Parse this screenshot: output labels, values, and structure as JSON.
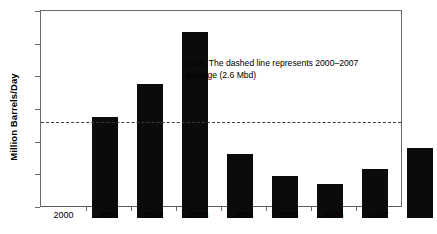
{
  "chart_data": {
    "type": "bar",
    "title": "",
    "subtitle": "",
    "xlabel": "",
    "ylabel": "Million Barrels/Day",
    "categories": [
      "2000",
      "2001",
      "2002",
      "2003",
      "2004",
      "2005",
      "2006",
      "2007"
    ],
    "values": [
      3.1,
      4.1,
      5.7,
      1.95,
      1.3,
      1.05,
      1.5,
      2.15
    ],
    "series": [
      {
        "name": "Production",
        "values": [
          3.1,
          4.1,
          5.7,
          1.95,
          1.3,
          1.05,
          1.5,
          2.15
        ]
      }
    ],
    "ylim": [
      0,
      6
    ],
    "ytick_values": [
      0,
      1,
      2,
      3,
      4,
      5,
      6
    ],
    "ytick_labels": [
      "0",
      "1",
      "2",
      "3",
      "4",
      "5",
      "6"
    ],
    "grid": false,
    "legend": false,
    "legend_position": "none",
    "bar_color": "#0b0b0b",
    "reference_line": {
      "value": 2.6,
      "style": "dashed",
      "color": "#3b3b3b",
      "label": "2000-2007 average (2.6 Mbd)"
    },
    "annotations": [
      {
        "name": "note",
        "line1": "Note: The dashed line represents 2000–2007",
        "line2": "average (2.6 Mbd)"
      }
    ]
  },
  "note": {
    "line1": "Note: The dashed line represents 2000–2007",
    "line2": "average (2.6 Mbd)"
  }
}
